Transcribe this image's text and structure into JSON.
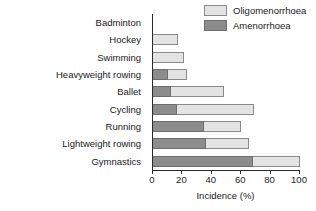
{
  "chart_data": {
    "type": "bar",
    "orientation": "horizontal",
    "stacked": true,
    "title": "",
    "xlabel": "Incidence (%)",
    "ylabel": "",
    "xlim": [
      0,
      100
    ],
    "xticks": [
      0,
      20,
      40,
      60,
      80,
      100
    ],
    "xtick_labels": [
      "0",
      "20",
      "40",
      "60",
      "80",
      "100"
    ],
    "grid": false,
    "legend_position": "top-right",
    "categories": [
      "Badminton",
      "Hockey",
      "Swimming",
      "Heavyweight rowing",
      "Ballet",
      "Cycling",
      "Running",
      "Lightweight rowing",
      "Gymnastics"
    ],
    "series": [
      {
        "name": "Amenorrhoea",
        "color": "#8c8c8c",
        "values": [
          0,
          0,
          0,
          10,
          12,
          16,
          35,
          36,
          68
        ]
      },
      {
        "name": "Oligomenorrhoea",
        "color": "#e3e3e3",
        "values": [
          0,
          17,
          21,
          13,
          36,
          53,
          25,
          29,
          32
        ]
      }
    ],
    "totals": [
      0,
      17,
      21,
      23,
      48,
      69,
      60,
      65,
      100
    ]
  },
  "legend": {
    "items": [
      {
        "label": "Oligomenorrhoea",
        "swatch": "oligo"
      },
      {
        "label": "Amenorrhoea",
        "swatch": "amen"
      }
    ]
  },
  "axis": {
    "x_label": "Incidence (%)"
  }
}
